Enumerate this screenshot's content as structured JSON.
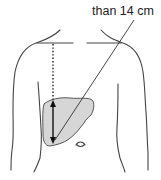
{
  "figure": {
    "label_text": "than 14 cm",
    "colors": {
      "outline": "#444444",
      "liver_fill": "#d6d6d6",
      "text": "#222222"
    },
    "elements": [
      "torso-outline",
      "clavicle-lines",
      "midclavicular-dotted-line",
      "liver-shape",
      "liver-span-double-arrow",
      "leader-line",
      "navel"
    ]
  }
}
